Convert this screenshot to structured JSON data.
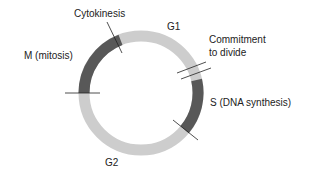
{
  "diagram": {
    "colors": {
      "interphase": "#cdcdcd",
      "highlight": "#585858",
      "line": "#222222",
      "text": "#222222"
    },
    "labels": {
      "cytokinesis": "Cytokinesis",
      "g1": "G1",
      "commitment_line1": "Commitment",
      "commitment_line2": "to divide",
      "mitosis": "M (mitosis)",
      "s_phase": "S (DNA synthesis)",
      "g2": "G2"
    }
  }
}
